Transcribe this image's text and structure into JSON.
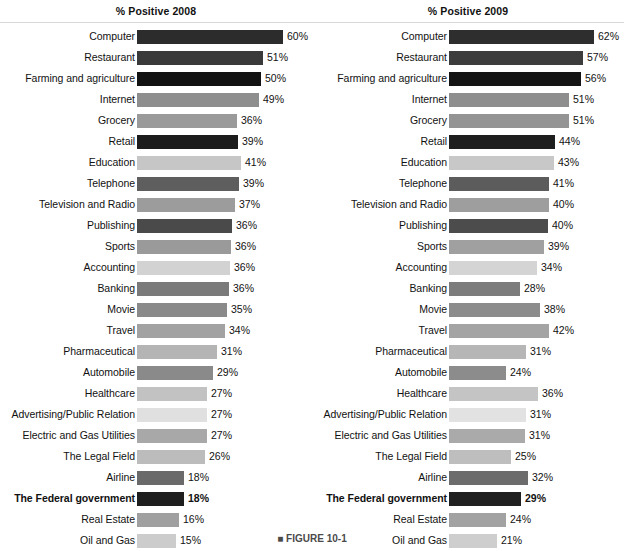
{
  "figure": {
    "caption": "■ FIGURE 10-1",
    "panels": [
      {
        "id": "2008",
        "header": "% Positive 2008"
      },
      {
        "id": "2009",
        "header": "% Positive 2009"
      }
    ]
  },
  "chart_data": {
    "type": "bar",
    "title": "",
    "xlabel": "",
    "ylabel": "",
    "orientation": "horizontal",
    "grid": false,
    "legend": false,
    "xlim": [
      0,
      62
    ],
    "value_suffix": "%",
    "categories": [
      "Computer",
      "Restaurant",
      "Farming and agriculture",
      "Internet",
      "Grocery",
      "Retail",
      "Education",
      "Telephone",
      "Television and Radio",
      "Publishing",
      "Sports",
      "Accounting",
      "Banking",
      "Movie",
      "Travel",
      "Pharmaceutical",
      "Automobile",
      "Healthcare",
      "Advertising/Public Relation",
      "Electric and Gas Utilities",
      "The Legal Field",
      "Airline",
      "The Federal government",
      "Real Estate",
      "Oil and Gas"
    ],
    "highlight_category": "The Federal government",
    "series": [
      {
        "name": "% Positive 2008",
        "values": [
          60,
          51,
          50,
          49,
          36,
          39,
          41,
          39,
          37,
          36,
          36,
          36,
          36,
          35,
          34,
          31,
          29,
          27,
          27,
          27,
          26,
          18,
          18,
          16,
          15
        ],
        "labels": [
          "60%",
          "51%",
          "50%",
          "49%",
          "36%",
          "39%",
          "41%",
          "39%",
          "37%",
          "36%",
          "36%",
          "36%",
          "36%",
          "35%",
          "34%",
          "31%",
          "29%",
          "27%",
          "27%",
          "27%",
          "26%",
          "18%",
          "18%",
          "16%",
          "15%"
        ],
        "bar_pixel_lengths": [
          146,
          126,
          124,
          122,
          100,
          101,
          104,
          102,
          98,
          95,
          94,
          93,
          92,
          90,
          88,
          80,
          76,
          70,
          70,
          70,
          68,
          47,
          47,
          42,
          39
        ],
        "bar_colors": [
          "#2c2c2c",
          "#3a3a3a",
          "#121212",
          "#8e8e8e",
          "#9a9a9a",
          "#1c1c1c",
          "#c6c6c6",
          "#5e5e5e",
          "#9c9c9c",
          "#4a4a4a",
          "#9a9a9a",
          "#d2d2d2",
          "#7a7a7a",
          "#8a8a8a",
          "#a2a2a2",
          "#b4b4b4",
          "#8a8a8a",
          "#c2c2c2",
          "#e0e0e0",
          "#a8a8a8",
          "#bcbcbc",
          "#6a6a6a",
          "#1e1e1e",
          "#a0a0a0",
          "#cccccc"
        ]
      },
      {
        "name": "% Positive 2009",
        "values": [
          62,
          57,
          56,
          51,
          51,
          44,
          43,
          41,
          40,
          40,
          39,
          34,
          28,
          38,
          42,
          31,
          24,
          36,
          31,
          31,
          25,
          32,
          29,
          24,
          21
        ],
        "labels": [
          "62%",
          "57%",
          "56%",
          "51%",
          "51%",
          "44%",
          "43%",
          "41%",
          "40%",
          "40%",
          "39%",
          "34%",
          "28%",
          "38%",
          "42%",
          "31%",
          "24%",
          "36%",
          "31%",
          "31%",
          "25%",
          "32%",
          "29%",
          "24%",
          "21%"
        ],
        "bar_pixel_lengths": [
          145,
          134,
          132,
          120,
          120,
          106,
          105,
          100,
          100,
          99,
          95,
          88,
          71,
          91,
          100,
          77,
          57,
          89,
          77,
          76,
          62,
          79,
          72,
          57,
          48
        ],
        "bar_colors": [
          "#2e2e2e",
          "#3c3c3c",
          "#141414",
          "#8e8e8e",
          "#949494",
          "#1e1e1e",
          "#c8c8c8",
          "#5c5c5c",
          "#9e9e9e",
          "#4c4c4c",
          "#a0a0a0",
          "#d4d4d4",
          "#7c7c7c",
          "#8c8c8c",
          "#a4a4a4",
          "#b6b6b6",
          "#8c8c8c",
          "#c4c4c4",
          "#e2e2e2",
          "#aaaaaa",
          "#bebebe",
          "#6c6c6c",
          "#202020",
          "#a2a2a2",
          "#cecece"
        ]
      }
    ]
  }
}
